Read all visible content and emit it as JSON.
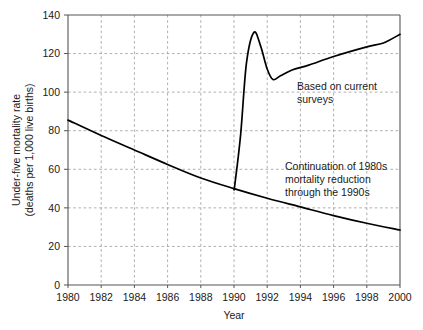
{
  "chart_data": {
    "type": "line",
    "title": "",
    "xlabel": "Year",
    "ylabel": "Under-five mortality rate (deaths per 1,000 live births)",
    "ylabel_line1": "Under-five mortality rate",
    "ylabel_line2": "(deaths per 1,000 live births)",
    "xlim": [
      1980,
      2000
    ],
    "ylim": [
      0,
      140
    ],
    "grid": true,
    "legend_position": "none",
    "xticks": [
      1980,
      1982,
      1984,
      1986,
      1988,
      1990,
      1992,
      1994,
      1996,
      1998,
      2000
    ],
    "xtick_labels": [
      "1980",
      "1982",
      "1984",
      "1986",
      "1988",
      "1990",
      "1992",
      "1994",
      "1996",
      "1998",
      "2000"
    ],
    "yticks": [
      0,
      20,
      40,
      60,
      80,
      100,
      120,
      140
    ],
    "ytick_labels": [
      "0",
      "20",
      "40",
      "60",
      "80",
      "100",
      "120",
      "140"
    ],
    "series": [
      {
        "name": "Continuation of 1980s mortality reduction through the 1990s",
        "x": [
          1980,
          1982,
          1984,
          1986,
          1988,
          1990,
          1992,
          1994,
          1996,
          1998,
          2000
        ],
        "values": [
          85.5,
          77.5,
          70.0,
          62.5,
          55.5,
          50.0,
          45.0,
          40.5,
          36.0,
          32.0,
          28.5
        ]
      },
      {
        "name": "Based on current surveys",
        "x": [
          1990,
          1990.05,
          1990.4,
          1990.75,
          1991.2,
          1991.6,
          1992.0,
          1992.35,
          1992.8,
          1993.5,
          1994.5,
          1996.0,
          1998.0,
          1999.0,
          2000
        ],
        "values": [
          50.0,
          52.0,
          78.0,
          115.0,
          131.0,
          124.0,
          112.0,
          106.5,
          108.5,
          111.5,
          114.0,
          118.5,
          123.5,
          125.5,
          130.0
        ]
      }
    ],
    "annotations": [
      {
        "id": "annotation-current-surveys",
        "lines": [
          "Based on current",
          "surveys"
        ],
        "x_data": 1993.6,
        "y_data": 103.0
      },
      {
        "id": "annotation-continuation-1980s",
        "lines": [
          "Continuation of 1980s",
          "mortality reduction",
          "through the 1990s"
        ],
        "x_data": 1992.7,
        "y_data": 62.0
      }
    ]
  }
}
